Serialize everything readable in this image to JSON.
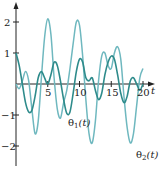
{
  "chart_data": {
    "type": "line",
    "title": "",
    "xlabel": "t",
    "ylabel": "",
    "xlim": [
      0,
      21
    ],
    "ylim": [
      -2.5,
      2.5
    ],
    "x_ticks": [
      5,
      10,
      15,
      20
    ],
    "y_ticks": [
      -2,
      -1,
      1,
      2
    ],
    "grid": false,
    "legend": "inline labels",
    "series": [
      {
        "name": "θ1(t)",
        "color": "#2e8b8b",
        "x": [
          0,
          0.5,
          1,
          1.5,
          2,
          2.5,
          3,
          3.5,
          4,
          4.5,
          5,
          5.5,
          6,
          6.5,
          7,
          7.5,
          8,
          8.5,
          9,
          9.5,
          10,
          10.5,
          11,
          11.5,
          12,
          12.5,
          13,
          13.5,
          14,
          14.5,
          15,
          15.5,
          16,
          16.5,
          17,
          17.5,
          18,
          18.5,
          19,
          19.5,
          20
        ],
        "values": [
          1.0,
          0.6,
          0.0,
          -0.6,
          -0.9,
          -0.85,
          -0.4,
          0.2,
          0.4,
          0.2,
          0.0,
          0.3,
          0.7,
          0.6,
          0.1,
          -0.5,
          -0.95,
          -0.9,
          -0.3,
          0.4,
          0.8,
          0.7,
          0.2,
          0.1,
          0.2,
          -0.2,
          -0.5,
          -0.3,
          0.3,
          0.7,
          0.9,
          0.8,
          0.3,
          -0.3,
          -0.6,
          -0.4,
          0.1,
          0.2,
          0.0,
          -0.2,
          0.0
        ]
      },
      {
        "name": "θ2(t)",
        "color": "#6fb8bf",
        "x": [
          0,
          0.5,
          1,
          1.5,
          2,
          2.5,
          3,
          3.5,
          4,
          4.5,
          5,
          5.5,
          6,
          6.5,
          7,
          7.5,
          8,
          8.5,
          9,
          9.5,
          10,
          10.5,
          11,
          11.5,
          12,
          12.5,
          13,
          13.5,
          14,
          14.5,
          15,
          15.5,
          16,
          16.5,
          17,
          17.5,
          18,
          18.5,
          19,
          19.5,
          20
        ],
        "values": [
          0.0,
          -0.15,
          0.1,
          0.4,
          0.1,
          -0.8,
          -1.6,
          -1.2,
          0.2,
          1.5,
          2.1,
          1.6,
          0.2,
          -0.8,
          -1.1,
          -0.6,
          -0.2,
          0.5,
          1.3,
          2.0,
          1.9,
          0.9,
          -0.5,
          -1.6,
          -1.9,
          -1.2,
          0.1,
          0.9,
          1.0,
          0.6,
          0.5,
          1.0,
          1.2,
          0.8,
          -0.4,
          -1.4,
          -1.9,
          -1.6,
          -0.7,
          0.2,
          0.5
        ]
      }
    ],
    "annotations": [
      {
        "text": "θ1(t)",
        "near_t": 13,
        "near_value": -1.3
      },
      {
        "text": "θ2(t)",
        "near_t": 19.5,
        "near_value": -2.3
      }
    ]
  },
  "labels": {
    "x_axis": "t",
    "x_ticks": [
      "5",
      "10",
      "15",
      "20"
    ],
    "y_ticks": [
      "2",
      "1",
      "−1",
      "−2"
    ],
    "theta1": "θ",
    "theta1_sub": "1",
    "theta1_arg": "(t)",
    "theta2": "θ",
    "theta2_sub": "2",
    "theta2_arg": "(t)"
  }
}
